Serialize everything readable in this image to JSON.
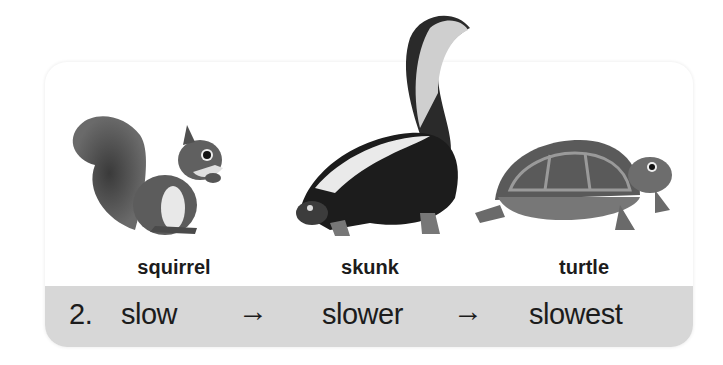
{
  "exercise": {
    "number": "2.",
    "words": [
      "slow",
      "slower",
      "slowest"
    ],
    "arrow": "→",
    "animals": [
      {
        "label": "squirrel",
        "icon": "squirrel-icon"
      },
      {
        "label": "skunk",
        "icon": "skunk-icon"
      },
      {
        "label": "turtle",
        "icon": "turtle-icon"
      }
    ]
  },
  "colors": {
    "card": "#ffffff",
    "strip": "#d7d7d7",
    "text": "#1c1c1c"
  }
}
